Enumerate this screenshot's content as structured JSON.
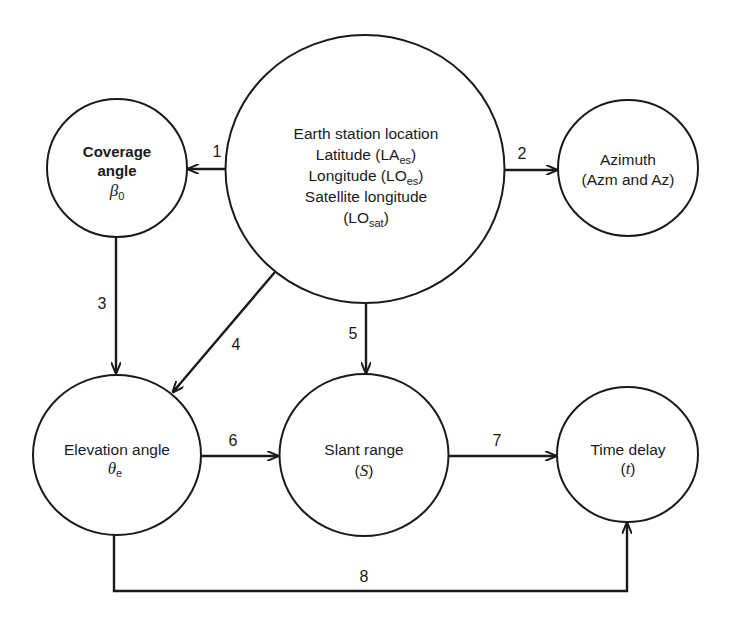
{
  "diagram": {
    "type": "flow",
    "nodes": {
      "earth_station": {
        "lines": [
          "Earth station location",
          "Latitude (LA",
          "es",
          ")",
          "Longitude (LO",
          "es",
          ")",
          "Satellite longitude",
          "(LO",
          "sat",
          ")"
        ],
        "title": "Earth station location",
        "latitude_label": "Latitude (LA",
        "latitude_sub": "es",
        "longitude_label": "Longitude (LO",
        "longitude_sub": "es",
        "sat_label": "Satellite longitude",
        "sat_open": "(LO",
        "sat_sub": "sat",
        "close": ")"
      },
      "coverage": {
        "line1": "Coverage",
        "line2": "angle",
        "symbol": "β",
        "symbol_sub": "0"
      },
      "azimuth": {
        "line1": "Azimuth",
        "line2": "(Azm and Az)"
      },
      "elevation": {
        "line1": "Elevation angle",
        "symbol": "θ",
        "symbol_sub": "e"
      },
      "slant_range": {
        "line1": "Slant range",
        "open": "(",
        "symbol": "S",
        "close": ")"
      },
      "time_delay": {
        "line1": "Time delay",
        "open": "(",
        "symbol": "t",
        "close": ")"
      }
    },
    "edges": [
      {
        "label": "1",
        "from": "Earth station location",
        "to": "Coverage angle"
      },
      {
        "label": "2",
        "from": "Earth station location",
        "to": "Azimuth"
      },
      {
        "label": "3",
        "from": "Coverage angle",
        "to": "Elevation angle"
      },
      {
        "label": "4",
        "from": "Earth station location",
        "to": "Elevation angle"
      },
      {
        "label": "5",
        "from": "Earth station location",
        "to": "Slant range"
      },
      {
        "label": "6",
        "from": "Elevation angle",
        "to": "Slant range"
      },
      {
        "label": "7",
        "from": "Slant range",
        "to": "Time delay"
      },
      {
        "label": "8",
        "from": "Elevation angle",
        "to": "Time delay"
      }
    ]
  }
}
